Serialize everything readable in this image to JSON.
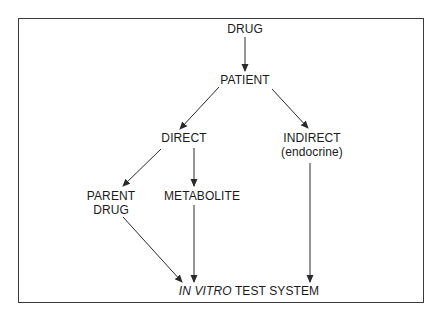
{
  "diagram": {
    "type": "flowchart",
    "nodes": {
      "drug": {
        "label": "DRUG"
      },
      "patient": {
        "label": "PATIENT"
      },
      "direct": {
        "label": "DIRECT"
      },
      "indirect": {
        "label": "INDIRECT",
        "sublabel": "(endocrine)"
      },
      "parent_drug": {
        "line1": "PARENT",
        "line2": "DRUG"
      },
      "metabolite": {
        "label": "METABOLITE"
      },
      "test_system": {
        "italic_part": "IN VITRO",
        "rest": " TEST SYSTEM"
      }
    },
    "edges": [
      {
        "from": "DRUG",
        "to": "PATIENT"
      },
      {
        "from": "PATIENT",
        "to": "DIRECT"
      },
      {
        "from": "PATIENT",
        "to": "INDIRECT (endocrine)"
      },
      {
        "from": "DIRECT",
        "to": "PARENT DRUG"
      },
      {
        "from": "DIRECT",
        "to": "METABOLITE"
      },
      {
        "from": "PARENT DRUG",
        "to": "IN VITRO TEST SYSTEM"
      },
      {
        "from": "METABOLITE",
        "to": "IN VITRO TEST SYSTEM"
      },
      {
        "from": "INDIRECT (endocrine)",
        "to": "IN VITRO TEST SYSTEM"
      }
    ],
    "colors": {
      "line": "#2a2a2a",
      "text": "#1a1a1a",
      "background": "#ffffff"
    }
  }
}
